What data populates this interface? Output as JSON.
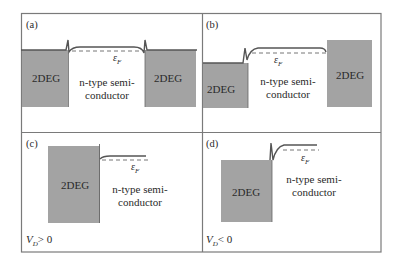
{
  "figure": {
    "colors": {
      "frame": "#7a7a7a",
      "region_fill": "#a3a3a3",
      "band_line": "#555555",
      "fermi_dash": "#777777",
      "text": "#2a2a2a"
    },
    "panels": [
      {
        "id": "a",
        "label": "(a)",
        "regions": [
          {
            "name": "left-2deg",
            "label": "2DEG"
          },
          {
            "name": "semiconductor",
            "label_line1": "n-type semi-",
            "label_line2": "conductor"
          },
          {
            "name": "right-2deg",
            "label": "2DEG"
          }
        ],
        "fermi_label": "ε",
        "fermi_sub": "F",
        "bias_label": ""
      },
      {
        "id": "b",
        "label": "(b)",
        "regions": [
          {
            "name": "left-2deg",
            "label": "2DEG"
          },
          {
            "name": "semiconductor",
            "label_line1": "n-type semi-",
            "label_line2": "conductor"
          },
          {
            "name": "right-2deg",
            "label": "2DEG"
          }
        ],
        "fermi_label": "ε",
        "fermi_sub": "F",
        "bias_label": ""
      },
      {
        "id": "c",
        "label": "(c)",
        "regions": [
          {
            "name": "left-2deg",
            "label": "2DEG"
          },
          {
            "name": "semiconductor",
            "label_line1": "n-type semi-",
            "label_line2": "conductor"
          }
        ],
        "fermi_label": "ε",
        "fermi_sub": "F",
        "bias_var": "V",
        "bias_sub": "D",
        "bias_rel": "> 0"
      },
      {
        "id": "d",
        "label": "(d)",
        "regions": [
          {
            "name": "left-2deg",
            "label": "2DEG"
          },
          {
            "name": "semiconductor",
            "label_line1": "n-type semi-",
            "label_line2": "conductor"
          }
        ],
        "fermi_label": "ε",
        "fermi_sub": "F",
        "bias_var": "V",
        "bias_sub": "D",
        "bias_rel": "< 0"
      }
    ]
  }
}
